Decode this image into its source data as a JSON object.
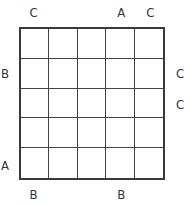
{
  "puzzle": {
    "rows": 5,
    "cols": 5,
    "clues": {
      "top": [
        "C",
        "",
        "",
        "A",
        "C"
      ],
      "bottom": [
        "B",
        "",
        "",
        "B",
        ""
      ],
      "left": [
        "",
        "B",
        "",
        "",
        "A"
      ],
      "right": [
        "",
        "C",
        "C",
        "",
        ""
      ]
    },
    "cells": [
      [
        "",
        "",
        "",
        "",
        ""
      ],
      [
        "",
        "",
        "",
        "",
        ""
      ],
      [
        "",
        "",
        "",
        "",
        ""
      ],
      [
        "",
        "",
        "",
        "",
        ""
      ],
      [
        "",
        "",
        "",
        "",
        ""
      ]
    ]
  }
}
